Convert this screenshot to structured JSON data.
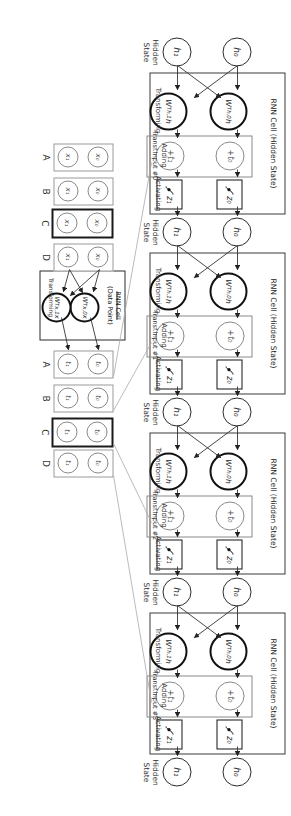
{
  "colors": {
    "ink": "#2b2b2b",
    "muted": "#8a8a8a",
    "connector": "#aaaaaa"
  },
  "hidden_state": {
    "label_line1": "Hidden",
    "label_line2": "State",
    "top": "h₀",
    "bottom": "h₁"
  },
  "cells": [
    {
      "title": "RNN Cell (Hidden State)",
      "transforming": "Transforming",
      "adding_line1": "Adding",
      "adding_line2": "Transf.Input #0",
      "activating": "Activating",
      "w_top": "W|T|h,0|h",
      "w_bottom": "W|T|h,1|h",
      "add_top": "+t₀",
      "add_bottom": "+t₁",
      "z_top": "z₀",
      "z_bottom": "z₁"
    },
    {
      "title": "RNN Cell (Hidden State)",
      "transforming": "Transforming",
      "adding_line1": "Adding",
      "adding_line2": "Transf.Input #1",
      "activating": "Activating",
      "w_top": "W|T|h,0|h",
      "w_bottom": "W|T|h,1|h",
      "add_top": "+t₀",
      "add_bottom": "+t₁",
      "z_top": "z₀",
      "z_bottom": "z₁"
    },
    {
      "title": "RNN Cell (Hidden State)",
      "transforming": "Transforming",
      "adding_line1": "Adding",
      "adding_line2": "Transf.Input #2",
      "activating": "Activating",
      "w_top": "W|T|h,0|h",
      "w_bottom": "W|T|h,1|h",
      "add_top": "+t₀",
      "add_bottom": "+t₁",
      "z_top": "z₀",
      "z_bottom": "z₁"
    },
    {
      "title": "RNN Cell (Hidden State)",
      "transforming": "Transforming",
      "adding_line1": "Adding",
      "adding_line2": "Transf.Input #3",
      "activating": "Activating",
      "w_top": "W|T|h,0|h",
      "w_bottom": "W|T|h,1|h",
      "add_top": "+t₀",
      "add_bottom": "+t₁",
      "z_top": "z₀",
      "z_bottom": "z₁"
    }
  ],
  "data_cell": {
    "struck_title": "RNN Cell",
    "title": "(Data Point)",
    "transforming": "Transforming",
    "w_top": "W|T|x,0|x",
    "w_bottom": "W|T|x,1|x"
  },
  "x_inputs": [
    {
      "letter": "A",
      "top": "x₀",
      "bottom": "x₁",
      "bold": false
    },
    {
      "letter": "B",
      "top": "x₀",
      "bottom": "x₁",
      "bold": false
    },
    {
      "letter": "C",
      "top": "x₀",
      "bottom": "x₁",
      "bold": true
    },
    {
      "letter": "D",
      "top": "x₀",
      "bottom": "x₁",
      "bold": false
    }
  ],
  "t_outputs": [
    {
      "letter": "A",
      "top": "t₀",
      "bottom": "t₁",
      "bold": false
    },
    {
      "letter": "B",
      "top": "t₀",
      "bottom": "t₁",
      "bold": false
    },
    {
      "letter": "C",
      "top": "t₀",
      "bottom": "t₁",
      "bold": true
    },
    {
      "letter": "D",
      "top": "t₀",
      "bottom": "t₁",
      "bold": false
    }
  ]
}
